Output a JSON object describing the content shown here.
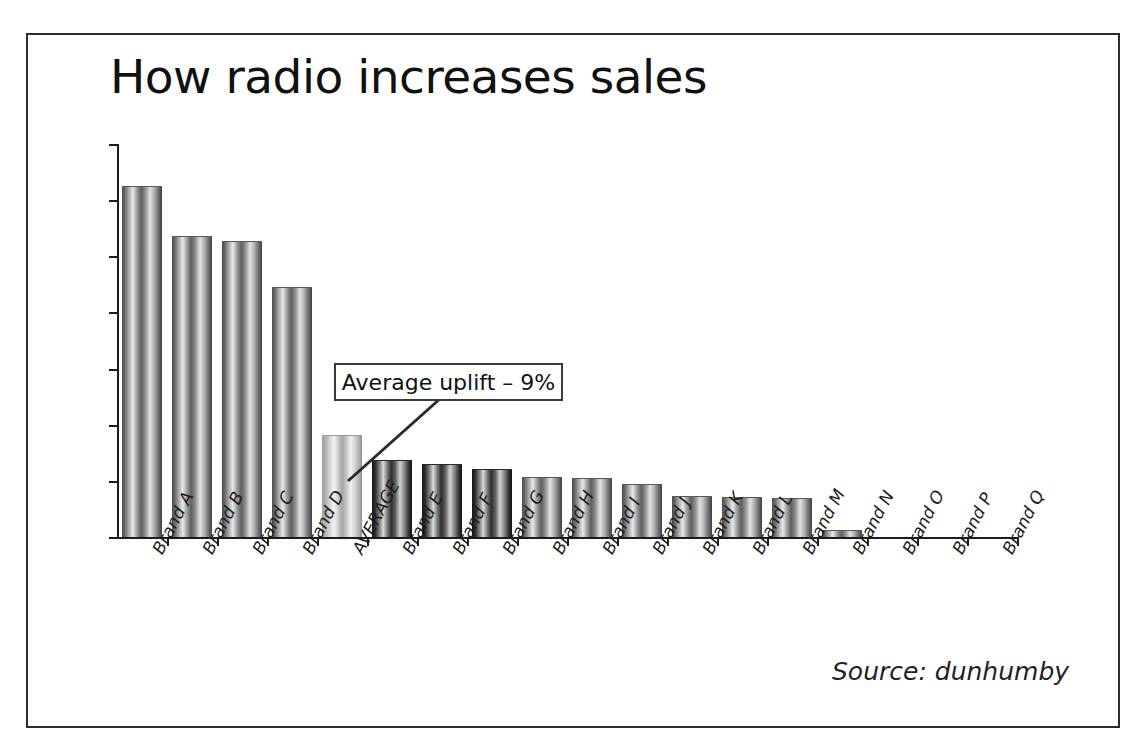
{
  "slide": {
    "title": "How radio increases sales",
    "source_note": "Source: dunhumby",
    "annotation": "Average uplift – 9%"
  },
  "colors": {
    "frame": "#2c2c2c",
    "axis": "#1c1c1c",
    "text": "#111111",
    "bar_dark": "#4a4a4a",
    "bar_very_dark": "#151515",
    "bar_light_average": "#cfcfcf",
    "annotation_border": "#3a3a3a"
  },
  "chart_data": {
    "type": "bar",
    "title": "How radio increases sales",
    "xlabel": "",
    "ylabel": "",
    "ylim": [
      0,
      35
    ],
    "yticks": [
      0,
      5,
      10,
      15,
      20,
      25,
      30,
      35
    ],
    "grid": false,
    "legend": "none",
    "categories": [
      "Brand A",
      "Brand B",
      "Brand C",
      "Brand D",
      "AVERAGE",
      "Brand E",
      "Brand F",
      "Brand G",
      "Brand H",
      "Brand I",
      "Brand J",
      "Brand K",
      "Brand L",
      "Brand M",
      "Brand N",
      "Brand O",
      "Brand P",
      "Brand Q"
    ],
    "values": [
      31.2,
      26.7,
      26.3,
      22.2,
      9.0,
      6.8,
      6.4,
      6.0,
      5.3,
      5.2,
      4.6,
      3.6,
      3.5,
      3.4,
      0.5,
      0,
      0,
      0
    ],
    "bar_styles": [
      "dark",
      "dark",
      "dark",
      "dark",
      "light",
      "verydark",
      "verydark",
      "verydark",
      "dark",
      "dark",
      "dark",
      "dark",
      "dark",
      "dark",
      "dark",
      "dark",
      "dark",
      "dark"
    ],
    "annotations": [
      {
        "text": "Average uplift – 9%",
        "points_to": "AVERAGE"
      }
    ],
    "source": "Source: dunhumby"
  }
}
